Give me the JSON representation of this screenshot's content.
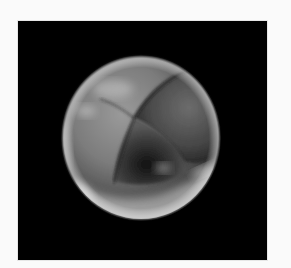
{
  "image": {
    "subject": "embryo-cleavage-stage-microscopy",
    "background_color": "#000000",
    "border_color": "#fafafa",
    "cells_visible": 4
  }
}
